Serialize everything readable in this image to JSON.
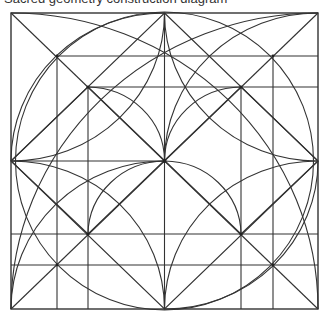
{
  "caption": {
    "text": "Sacred geometry construction diagram"
  },
  "figure": {
    "type": "geometric-construction",
    "stroke_color": "#333333",
    "background": "#ffffff",
    "outer_square": {
      "x": 11,
      "y": 13,
      "w": 307,
      "h": 296
    },
    "center": {
      "x": 164.5,
      "y": 161
    },
    "inner_square_large": {
      "x": 57,
      "y": 56,
      "w": 216,
      "h": 209
    },
    "inner_square_small": {
      "x": 88,
      "y": 87,
      "w": 153,
      "h": 147
    }
  }
}
